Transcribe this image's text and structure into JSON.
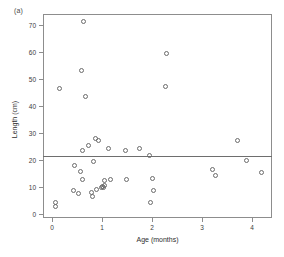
{
  "figure": {
    "panel_label": "(a)",
    "background_color": "#ffffff"
  },
  "chart_data": {
    "type": "scatter",
    "title": "",
    "panel_label": "(a)",
    "xlabel": "Age (months)",
    "ylabel": "Length (cm)",
    "xlim": [
      -0.18,
      4.4
    ],
    "ylim": [
      -1.5,
      74
    ],
    "xticks": [
      0,
      1,
      2,
      3,
      4
    ],
    "xtick_labels": [
      "0",
      "1",
      "2",
      "3",
      "4"
    ],
    "yticks": [
      0,
      10,
      20,
      30,
      40,
      50,
      60,
      70
    ],
    "ytick_labels": [
      "0",
      "10",
      "20",
      "30",
      "40",
      "50",
      "60",
      "70"
    ],
    "grid": false,
    "legend": null,
    "marker": "open-circle",
    "marker_color": "#6b6b6b",
    "reference_line": {
      "orientation": "horizontal",
      "y": 21.6,
      "color": "#6e6e6e",
      "label": ""
    },
    "x": [
      0.07,
      0.07,
      0.14,
      0.42,
      0.44,
      0.52,
      0.57,
      0.58,
      0.6,
      0.6,
      0.62,
      0.66,
      0.72,
      0.78,
      0.8,
      0.82,
      0.86,
      0.88,
      0.92,
      0.99,
      1.01,
      1.02,
      1.04,
      1.05,
      1.13,
      1.17,
      1.47,
      1.48,
      1.75,
      1.95,
      1.97,
      2.0,
      2.02,
      2.03,
      2.27,
      2.29,
      3.21,
      3.27,
      3.7,
      3.88,
      4.18
    ],
    "y": [
      4.2,
      2.6,
      46.3,
      8.8,
      18.0,
      7.4,
      15.6,
      53.0,
      23.6,
      12.9,
      71.4,
      25.2,
      43.5,
      7.9,
      6.6,
      27.8,
      19.3,
      27.0,
      9.9,
      10.2,
      9.8,
      12.4,
      10.4,
      9.0,
      24.4,
      12.8,
      23.3,
      12.8,
      24.3,
      21.6,
      4.3,
      13.3,
      8.6,
      59.3,
      47.0,
      16.3,
      14.3,
      27.0,
      19.9,
      15.3,
      12.0
    ],
    "points": [
      {
        "x": 0.07,
        "y": 4.2
      },
      {
        "x": 0.07,
        "y": 2.6
      },
      {
        "x": 0.14,
        "y": 46.3
      },
      {
        "x": 0.42,
        "y": 8.8
      },
      {
        "x": 0.44,
        "y": 18.0
      },
      {
        "x": 0.52,
        "y": 7.4
      },
      {
        "x": 0.57,
        "y": 15.6
      },
      {
        "x": 0.58,
        "y": 53.0
      },
      {
        "x": 0.6,
        "y": 23.6
      },
      {
        "x": 0.6,
        "y": 12.9
      },
      {
        "x": 0.62,
        "y": 71.4
      },
      {
        "x": 0.72,
        "y": 25.2
      },
      {
        "x": 0.66,
        "y": 43.5
      },
      {
        "x": 0.78,
        "y": 7.9
      },
      {
        "x": 0.8,
        "y": 6.6
      },
      {
        "x": 0.86,
        "y": 27.8
      },
      {
        "x": 0.82,
        "y": 19.3
      },
      {
        "x": 0.92,
        "y": 27.0
      },
      {
        "x": 0.99,
        "y": 9.9
      },
      {
        "x": 1.01,
        "y": 10.2
      },
      {
        "x": 1.02,
        "y": 9.8
      },
      {
        "x": 1.04,
        "y": 12.4
      },
      {
        "x": 1.05,
        "y": 10.4
      },
      {
        "x": 0.88,
        "y": 9.0
      },
      {
        "x": 1.13,
        "y": 24.4
      },
      {
        "x": 1.17,
        "y": 12.8
      },
      {
        "x": 1.47,
        "y": 23.3
      },
      {
        "x": 1.48,
        "y": 12.8
      },
      {
        "x": 1.75,
        "y": 24.3
      },
      {
        "x": 1.95,
        "y": 21.6
      },
      {
        "x": 1.97,
        "y": 4.3
      },
      {
        "x": 2.0,
        "y": 13.3
      },
      {
        "x": 2.02,
        "y": 8.6
      },
      {
        "x": 2.29,
        "y": 59.3
      },
      {
        "x": 2.27,
        "y": 47.0
      },
      {
        "x": 3.21,
        "y": 16.3
      },
      {
        "x": 3.27,
        "y": 14.3
      },
      {
        "x": 3.7,
        "y": 27.0
      },
      {
        "x": 3.88,
        "y": 19.9
      },
      {
        "x": 4.18,
        "y": 15.3
      }
    ]
  }
}
